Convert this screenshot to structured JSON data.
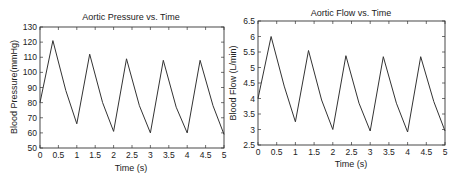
{
  "chart_data": [
    {
      "type": "line",
      "title": "Aortic Pressure vs. Time",
      "xlabel": "Time (s)",
      "ylabel": "Blood Pressure(mmHg)",
      "xlim": [
        0,
        5
      ],
      "ylim": [
        50,
        130
      ],
      "xticks": [
        0,
        0.5,
        1,
        1.5,
        2,
        2.5,
        3,
        3.5,
        4,
        4.5,
        5
      ],
      "xtick_labels": [
        "0",
        "0.5",
        "1",
        "1.5",
        "2",
        "2.5",
        "3",
        "3.5",
        "4",
        "4.5",
        "5"
      ],
      "yticks": [
        50,
        60,
        70,
        80,
        90,
        100,
        110,
        120,
        130
      ],
      "ytick_labels": [
        "50",
        "60",
        "70",
        "80",
        "90",
        "100",
        "110",
        "120",
        "130"
      ],
      "grid": false,
      "series": [
        {
          "name": "Aortic Pressure",
          "x": [
            0,
            0.35,
            0.7,
            1.0,
            1.35,
            1.7,
            2.0,
            2.35,
            2.7,
            3.0,
            3.35,
            3.7,
            4.0,
            4.35,
            4.7,
            5.0
          ],
          "y": [
            80,
            121,
            88,
            66,
            112,
            80,
            61,
            109,
            78,
            60,
            108,
            77,
            60,
            108,
            78,
            59
          ]
        }
      ]
    },
    {
      "type": "line",
      "title": "Aortic Flow vs. Time",
      "xlabel": "Time (s)",
      "ylabel": "Blood Flow (L/min)",
      "xlim": [
        0,
        5
      ],
      "ylim": [
        2.5,
        6.5
      ],
      "xticks": [
        0,
        0.5,
        1,
        1.5,
        2,
        2.5,
        3,
        3.5,
        4,
        4.5,
        5
      ],
      "xtick_labels": [
        "0",
        "0.5",
        "1",
        "1.5",
        "2",
        "2.5",
        "3",
        "3.5",
        "4",
        "4.5",
        "5"
      ],
      "yticks": [
        2.5,
        3,
        3.5,
        4,
        4.5,
        5,
        5.5,
        6,
        6.5
      ],
      "ytick_labels": [
        "2.5",
        "3",
        "3.5",
        "4",
        "4.5",
        "5",
        "5.5",
        "6",
        "6.5"
      ],
      "grid": false,
      "series": [
        {
          "name": "Aortic Flow",
          "x": [
            0,
            0.35,
            0.7,
            1.0,
            1.35,
            1.7,
            2.0,
            2.35,
            2.7,
            3.0,
            3.35,
            3.7,
            4.0,
            4.35,
            4.7,
            5.0
          ],
          "y": [
            4.0,
            6.0,
            4.4,
            3.25,
            5.55,
            3.95,
            3.0,
            5.38,
            3.85,
            2.95,
            5.35,
            3.85,
            2.92,
            5.35,
            3.9,
            2.95
          ]
        }
      ]
    }
  ]
}
